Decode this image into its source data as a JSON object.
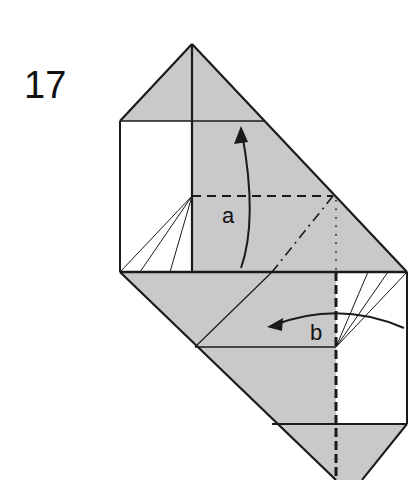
{
  "step": {
    "number": "17"
  },
  "labels": {
    "a": "a",
    "b": "b"
  },
  "colors": {
    "paper_gray": "#c9c9c9",
    "line": "#1a1a1a",
    "paper_white": "#ffffff"
  }
}
